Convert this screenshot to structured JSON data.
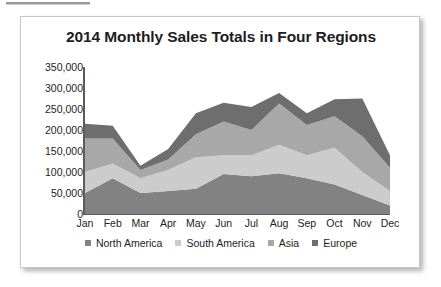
{
  "top_rule": {
    "name": "decorative-rule"
  },
  "card": {
    "title": "2014 Monthly Sales Totals in Four Regions"
  },
  "chart_data": {
    "type": "area",
    "stacked": true,
    "title": "2014 Monthly Sales Totals in Four Regions",
    "xlabel": "",
    "ylabel": "",
    "grid": false,
    "legend_position": "bottom",
    "categories": [
      "Jan",
      "Feb",
      "Mar",
      "Apr",
      "May",
      "Jun",
      "Jul",
      "Aug",
      "Sep",
      "Oct",
      "Nov",
      "Dec"
    ],
    "ylim": [
      0,
      350000
    ],
    "yticks": [
      0,
      50000,
      100000,
      150000,
      200000,
      250000,
      300000,
      350000
    ],
    "ytick_labels": [
      "0",
      "50,000",
      "100,000",
      "150,000",
      "200,000",
      "250,000",
      "300,000",
      "350,000"
    ],
    "series": [
      {
        "name": "North America",
        "color": "#828282",
        "values": [
          50000,
          85000,
          50000,
          55000,
          60000,
          95000,
          90000,
          97000,
          85000,
          70000,
          45000,
          20000
        ]
      },
      {
        "name": "South America",
        "color": "#cccccc",
        "values": [
          50000,
          35000,
          35000,
          50000,
          75000,
          45000,
          50000,
          68000,
          55000,
          88000,
          55000,
          35000
        ]
      },
      {
        "name": "Asia",
        "color": "#a8a8a8",
        "values": [
          80000,
          60000,
          20000,
          25000,
          55000,
          80000,
          60000,
          98000,
          72000,
          75000,
          85000,
          55000
        ]
      },
      {
        "name": "Europe",
        "color": "#6e6e6e",
        "values": [
          35000,
          30000,
          10000,
          25000,
          50000,
          45000,
          55000,
          25000,
          28000,
          40000,
          90000,
          30000
        ]
      }
    ],
    "series_totals": [
      215000,
      210000,
      115000,
      155000,
      240000,
      265000,
      255000,
      288000,
      240000,
      273000,
      275000,
      140000
    ]
  },
  "legend": {
    "entries": [
      {
        "label": "North America",
        "color": "#828282"
      },
      {
        "label": "South America",
        "color": "#cccccc"
      },
      {
        "label": "Asia",
        "color": "#a8a8a8"
      },
      {
        "label": "Europe",
        "color": "#6e6e6e"
      }
    ]
  }
}
